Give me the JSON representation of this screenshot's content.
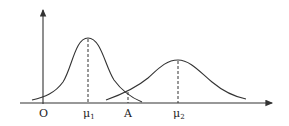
{
  "diagram": {
    "type": "two normal distribution curves",
    "axes": {
      "origin_label": "O",
      "x_axis_arrow": true,
      "y_axis_arrow": true
    },
    "curves": [
      {
        "name": "curve-1",
        "mean_label": "μ",
        "mean_sub": "1",
        "relative_height": "taller",
        "relative_width": "narrower"
      },
      {
        "name": "curve-2",
        "mean_label": "μ",
        "mean_sub": "2",
        "relative_height": "shorter",
        "relative_width": "wider"
      }
    ],
    "intersection_label": "A",
    "labels": {
      "origin": "O",
      "mu": "μ",
      "sub1": "1",
      "sub2": "2",
      "a": "A"
    },
    "colors": {
      "line": "#333333",
      "text": "#222222"
    }
  }
}
